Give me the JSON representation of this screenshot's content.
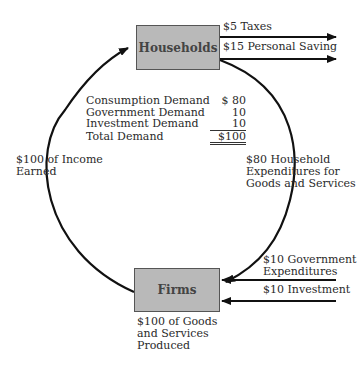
{
  "diagram": {
    "type": "circular-flow",
    "nodes": {
      "households": {
        "label": "Households"
      },
      "firms": {
        "label": "Firms"
      }
    },
    "outflows_from_households": [
      {
        "label": "$5 Taxes"
      },
      {
        "label": "$15 Personal Saving"
      }
    ],
    "inflows_to_firms": [
      {
        "label": "$10 Government",
        "label2": "Expenditures"
      },
      {
        "label": "$10 Investment"
      }
    ],
    "left_flow": {
      "line1": "$100 of Income",
      "line2": "Earned"
    },
    "right_flow": {
      "line1": "$80 Household",
      "line2": "Expenditures for",
      "line3": "Goods and Services"
    },
    "firms_output": {
      "line1": "$100 of Goods",
      "line2": "and Services",
      "line3": "Produced"
    },
    "demand_table": [
      {
        "label": "Consumption Demand",
        "value": "$ 80"
      },
      {
        "label": "Government Demand",
        "value": "10"
      },
      {
        "label": "Investment Demand",
        "value": "10"
      },
      {
        "label": "Total Demand",
        "value": "$100"
      }
    ]
  }
}
